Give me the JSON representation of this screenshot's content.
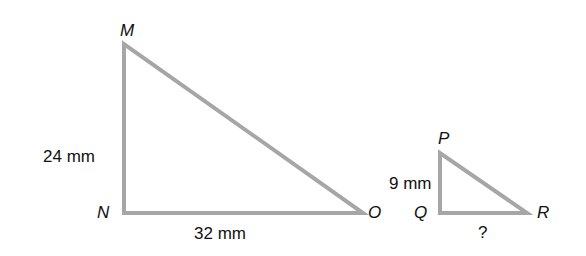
{
  "triangles": [
    {
      "name": "MNO",
      "vertices": {
        "M": {
          "label": "M",
          "x": 124,
          "y": 44
        },
        "N": {
          "label": "N",
          "x": 124,
          "y": 213
        },
        "O": {
          "label": "O",
          "x": 363,
          "y": 213
        }
      },
      "sides": {
        "MN": {
          "label": "24 mm"
        },
        "NO": {
          "label": "32 mm"
        }
      }
    },
    {
      "name": "PQR",
      "vertices": {
        "P": {
          "label": "P",
          "x": 440,
          "y": 153
        },
        "Q": {
          "label": "Q",
          "x": 440,
          "y": 213
        },
        "R": {
          "label": "R",
          "x": 527,
          "y": 213
        }
      },
      "sides": {
        "PQ": {
          "label": "9 mm"
        },
        "QR": {
          "label": "?"
        }
      }
    }
  ],
  "colors": {
    "stroke": "#a6a6a6",
    "text": "#111111"
  }
}
